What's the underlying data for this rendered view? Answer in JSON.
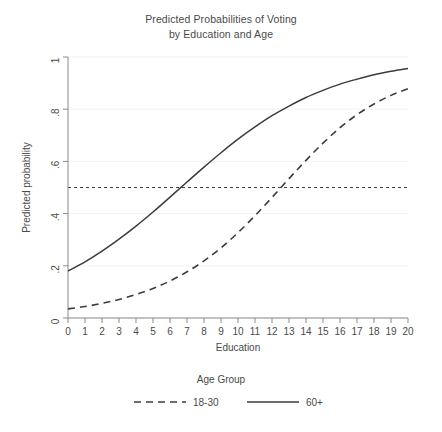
{
  "chart_data": {
    "type": "line",
    "title": "Predicted Probabilities of Voting",
    "subtitle": "by Education and Age",
    "title_lines": [
      "Predicted Probabilities of Voting",
      "by Education and Age"
    ],
    "xlabel": "Education",
    "ylabel": "Predicted probability",
    "xlim": [
      0,
      20
    ],
    "ylim": [
      0,
      1
    ],
    "xticks": [
      0,
      1,
      2,
      3,
      4,
      5,
      6,
      7,
      8,
      9,
      10,
      11,
      12,
      13,
      14,
      15,
      16,
      17,
      18,
      19,
      20
    ],
    "xtick_labels": [
      "0",
      "1",
      "2",
      "3",
      "4",
      "5",
      "6",
      "7",
      "8",
      "9",
      "10",
      "11",
      "12",
      "13",
      "14",
      "15",
      "16",
      "17",
      "18",
      "19",
      "20"
    ],
    "yticks": [
      0,
      0.2,
      0.4,
      0.6,
      0.8,
      1
    ],
    "ytick_labels": [
      "0",
      ".2",
      ".4",
      ".6",
      ".8",
      "1"
    ],
    "grid": "horizontal-faint",
    "legend_position": "bottom",
    "legend_title": "Age Group",
    "reference_lines": [
      {
        "orientation": "horizontal",
        "value": 0.5,
        "style": "dotted",
        "color": "#3c3c3c"
      }
    ],
    "x": [
      0,
      1,
      2,
      3,
      4,
      5,
      6,
      7,
      8,
      9,
      10,
      11,
      12,
      13,
      14,
      15,
      16,
      17,
      18,
      19,
      20
    ],
    "series": [
      {
        "name": "18-30",
        "style": "dashed",
        "color": "#3c3c3c",
        "values": [
          0.035,
          0.044,
          0.056,
          0.071,
          0.09,
          0.113,
          0.142,
          0.177,
          0.219,
          0.269,
          0.327,
          0.392,
          0.462,
          0.534,
          0.604,
          0.67,
          0.729,
          0.779,
          0.82,
          0.853,
          0.879
        ],
        "crosses_half_at": 13.1
      },
      {
        "name": "60+",
        "style": "solid",
        "color": "#3c3c3c",
        "values": [
          0.18,
          0.215,
          0.256,
          0.302,
          0.352,
          0.406,
          0.463,
          0.521,
          0.578,
          0.633,
          0.685,
          0.732,
          0.775,
          0.812,
          0.845,
          0.872,
          0.896,
          0.915,
          0.932,
          0.945,
          0.956
        ],
        "crosses_half_at": 6.3
      }
    ],
    "colors": {
      "line": "#3c3c3c",
      "axis": "#8a8a8a",
      "grid": "#f2f2f2",
      "text": "#4a4a4a",
      "background": "#ffffff"
    }
  },
  "legend": {
    "title": "Age Group",
    "entries": [
      {
        "label": "18-30",
        "style": "dashed"
      },
      {
        "label": "60+",
        "style": "solid"
      }
    ]
  }
}
